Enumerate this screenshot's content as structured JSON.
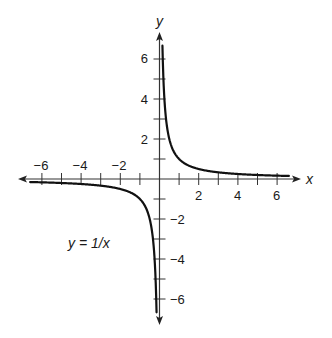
{
  "chart_data": {
    "type": "line",
    "title": "",
    "function": "y = 1/x",
    "annotation": "y = 1/x",
    "xlabel": "x",
    "ylabel": "y",
    "xlim": [
      -7,
      7
    ],
    "ylim": [
      -7,
      7
    ],
    "x_tick_labels": [
      "-6",
      "-4",
      "-2",
      "2",
      "4",
      "6"
    ],
    "x_tick_values": [
      -6,
      -4,
      -2,
      2,
      4,
      6
    ],
    "y_tick_labels": [
      "6",
      "4",
      "2",
      "-2",
      "-4",
      "-6"
    ],
    "y_tick_values": [
      6,
      4,
      2,
      -2,
      -4,
      -6
    ],
    "minor_ticks_every": 1,
    "grid": false,
    "legend": null,
    "series": [
      {
        "name": "y = 1/x (x > 0)",
        "x": [
          0.15,
          0.2,
          0.25,
          0.333,
          0.5,
          1,
          2,
          3,
          4,
          5,
          6,
          6.6
        ],
        "y": [
          6.67,
          5,
          4,
          3,
          2,
          1,
          0.5,
          0.333,
          0.25,
          0.2,
          0.167,
          0.152
        ]
      },
      {
        "name": "y = 1/x (x < 0)",
        "x": [
          -6.6,
          -6,
          -5,
          -4,
          -3,
          -2,
          -1,
          -0.5,
          -0.333,
          -0.25,
          -0.2,
          -0.15
        ],
        "y": [
          -0.152,
          -0.167,
          -0.2,
          -0.25,
          -0.333,
          -0.5,
          -1,
          -2,
          -3,
          -4,
          -5,
          -6.67
        ]
      }
    ],
    "colors": {
      "curve": "#111111",
      "axes": "#333333",
      "text": "#1a1a1a"
    }
  },
  "labels": {
    "x_axis": "x",
    "y_axis": "y",
    "equation": "y = 1/x",
    "x_ticks": [
      "−6",
      "−4",
      "−2",
      "2",
      "4",
      "6"
    ],
    "y_ticks_pos": [
      "6",
      "4",
      "2"
    ],
    "y_ticks_neg": [
      "−2",
      "−4",
      "−6"
    ]
  }
}
